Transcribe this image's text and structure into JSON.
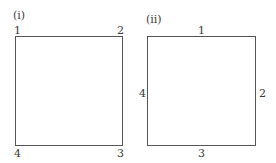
{
  "panels": [
    {
      "label": "(i)",
      "kind": "corner-numbered-square",
      "corners": {
        "top_left": "1",
        "top_right": "2",
        "bottom_right": "3",
        "bottom_left": "4"
      }
    },
    {
      "label": "(ii)",
      "kind": "side-numbered-square",
      "sides": {
        "top": "1",
        "right": "2",
        "bottom": "3",
        "left": "4"
      }
    }
  ],
  "colors": {
    "line": "#555555",
    "text": "#3a3a3a",
    "background": "#ffffff"
  }
}
